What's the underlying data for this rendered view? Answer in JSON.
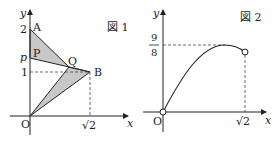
{
  "figure1": {
    "caption": "図 1",
    "axis_x_label": "x",
    "axis_y_label": "y",
    "origin_label": "O",
    "points": {
      "A": {
        "label": "A",
        "coords": [
          0,
          2
        ]
      },
      "P": {
        "label": "P",
        "coords": [
          0,
          "p"
        ]
      },
      "Q": {
        "label": "Q"
      },
      "B": {
        "label": "B",
        "coords": [
          "√2",
          1
        ]
      }
    },
    "y_ticks": [
      "2",
      "p",
      "1"
    ],
    "x_ticks": [
      "√2"
    ],
    "shaded_triangles": [
      [
        "A",
        "P",
        "Q"
      ],
      [
        "O",
        "Q",
        "B"
      ]
    ],
    "fill_color": "#c8c8c8",
    "line_color": "#222222"
  },
  "figure2": {
    "caption": "図 2",
    "axis_x_label": "x",
    "axis_y_label": "y",
    "origin_label": "O",
    "y_tick_fraction": {
      "numerator": "9",
      "denominator": "8"
    },
    "x_ticks": [
      "√2"
    ],
    "curve": "increasing from open point at O to maximum 9/8, then decreasing to open point at x=√2",
    "open_endpoints": [
      "O",
      "√2"
    ]
  }
}
